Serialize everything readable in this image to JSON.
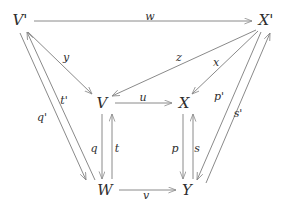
{
  "diagram": {
    "type": "commutative-diagram",
    "background_color": "#ffffff",
    "stroke_color": "#8a8a8a",
    "text_color": "#2e2e2e",
    "nodes": [
      {
        "id": "Vprime",
        "label": "V'",
        "x": 20,
        "y": 20
      },
      {
        "id": "Xprime",
        "label": "X'",
        "x": 266,
        "y": 20
      },
      {
        "id": "V",
        "label": "V",
        "x": 102,
        "y": 103
      },
      {
        "id": "X",
        "label": "X",
        "x": 184,
        "y": 103
      },
      {
        "id": "W",
        "label": "W",
        "x": 105,
        "y": 190
      },
      {
        "id": "Y",
        "label": "Y",
        "x": 187,
        "y": 190
      }
    ],
    "edges": [
      {
        "id": "w",
        "label": "w",
        "from": "Vprime",
        "to": "Xprime",
        "label_x": 150,
        "label_y": 16
      },
      {
        "id": "y",
        "label": "y",
        "from": "Vprime",
        "to": "V",
        "label_x": 66,
        "label_y": 57
      },
      {
        "id": "tprime",
        "label": "t'",
        "from": "W",
        "to": "Vprime",
        "label_x": 64,
        "label_y": 100
      },
      {
        "id": "qprime",
        "label": "q'",
        "from": "Vprime",
        "to": "W",
        "label_x": 42,
        "label_y": 117
      },
      {
        "id": "u",
        "label": "u",
        "from": "V",
        "to": "X",
        "label_x": 143,
        "label_y": 97
      },
      {
        "id": "z",
        "label": "z",
        "from": "Xprime",
        "to": "V",
        "label_x": 179,
        "label_y": 57
      },
      {
        "id": "x",
        "label": "x",
        "from": "Xprime",
        "to": "X",
        "label_x": 216,
        "label_y": 62
      },
      {
        "id": "q",
        "label": "q",
        "from": "V",
        "to": "W",
        "label_x": 94,
        "label_y": 148
      },
      {
        "id": "t",
        "label": "t",
        "from": "W",
        "to": "V",
        "label_x": 117,
        "label_y": 148
      },
      {
        "id": "p",
        "label": "p",
        "from": "X",
        "to": "Y",
        "label_x": 175,
        "label_y": 148
      },
      {
        "id": "s",
        "label": "s",
        "from": "Y",
        "to": "X",
        "label_x": 197,
        "label_y": 148
      },
      {
        "id": "pprime",
        "label": "p'",
        "from": "Xprime",
        "to": "Y",
        "label_x": 219,
        "label_y": 96
      },
      {
        "id": "sprime",
        "label": "s'",
        "from": "Y",
        "to": "Xprime",
        "label_x": 238,
        "label_y": 113
      },
      {
        "id": "v",
        "label": "v",
        "from": "W",
        "to": "Y",
        "label_x": 146,
        "label_y": 195
      }
    ]
  }
}
